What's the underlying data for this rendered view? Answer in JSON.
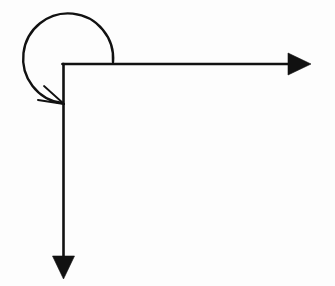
{
  "document": {
    "title": "Right-Angle Arrow With Circular Rotation Arc",
    "background_color": "#fdfdfd",
    "width": 335,
    "height": 286
  },
  "figure": {
    "name": "right-angle-arrow-with-rotation-arc",
    "stroke_color": "#111111",
    "fill_color": "#111111",
    "stroke_width": 2.6,
    "thin_stroke_width": 1.8
  },
  "chart_data": {
    "type": "diagram",
    "title": "",
    "xlabel": "",
    "ylabel": "",
    "grid": false,
    "legend": "none",
    "xlim": [
      0,
      335
    ],
    "ylim": [
      0,
      286
    ],
    "elements": [
      {
        "id": "corner-vertex",
        "kind": "point",
        "label": "",
        "x": 62.5,
        "y": 64
      },
      {
        "id": "horizontal-shaft",
        "kind": "line",
        "label": "",
        "x1": 62.5,
        "y1": 64,
        "x2": 289,
        "y2": 64
      },
      {
        "id": "horizontal-arrowhead",
        "kind": "triangle-filled",
        "label": "",
        "direction": "right",
        "tip_x": 311,
        "tip_y": 64,
        "base_x": 288,
        "half_width": 11
      },
      {
        "id": "vertical-shaft",
        "kind": "line",
        "label": "",
        "x1": 63.5,
        "y1": 63,
        "x2": 63.5,
        "y2": 256
      },
      {
        "id": "vertical-arrowhead",
        "kind": "triangle-filled",
        "label": "",
        "direction": "down",
        "tip_x": 63.5,
        "tip_y": 279,
        "base_y": 256,
        "half_width": 11
      },
      {
        "id": "rotation-arc",
        "kind": "arc",
        "label": "",
        "center_x": 68,
        "center_y": 66,
        "radius": 45,
        "start_angle_deg": -5,
        "sweep_deg": -272,
        "sweep_direction": "counter-clockwise",
        "start_x": 113,
        "start_y": 64,
        "end_x": 62,
        "end_y": 103
      },
      {
        "id": "arc-arrowhead",
        "kind": "open-barbs",
        "label": "",
        "tip_x": 64,
        "tip_y": 104,
        "barb_1_x": 38,
        "barb_1_y": 100,
        "barb_2_x": 44,
        "barb_2_y": 86
      }
    ],
    "annotations": []
  },
  "captions": []
}
